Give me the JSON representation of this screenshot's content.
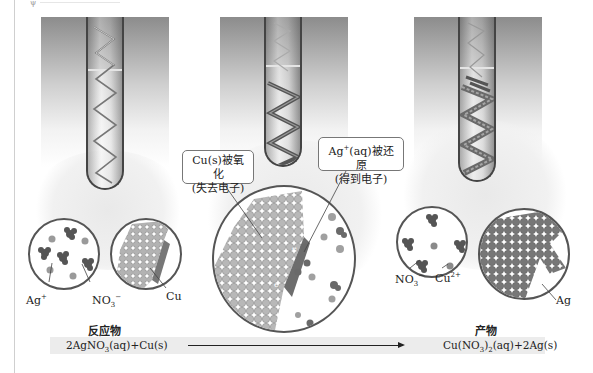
{
  "figure": {
    "stages": [
      {
        "id": "reactants",
        "description": "copper coil in silver nitrate solution"
      },
      {
        "id": "reaction",
        "description": "copper coil being coated with silver"
      },
      {
        "id": "products",
        "description": "silver crystals on coil, blue solution"
      }
    ],
    "callouts": {
      "oxidation": {
        "line1": "Cu(s)被氧化",
        "line2": "(失去电子)"
      },
      "reduction": {
        "line1_base": "Ag",
        "line1_sup": "+",
        "line1_rest": "(aq)被还原",
        "line2": "(得到电子)"
      }
    },
    "labels": {
      "ag_ion": {
        "base": "Ag",
        "sup": "+"
      },
      "nitrate_left": {
        "base": "NO",
        "sub": "3",
        "sup": "−"
      },
      "cu_left": "Cu",
      "nitrate_right": {
        "base": "NO",
        "sub": "3",
        "sup": "−"
      },
      "cu_ion": {
        "base": "Cu",
        "sup": "2+"
      },
      "ag_right": "Ag",
      "electron": "e"
    },
    "reactants_heading": "反应物",
    "products_heading": "产物",
    "equation": {
      "left": {
        "p1": "2AgNO",
        "sub": "3",
        "p2": "(aq)+Cu(s)"
      },
      "right": {
        "p1": "Cu(NO",
        "sub1": "3",
        "p2": ")",
        "sub2": "2",
        "p3": "(aq)+2Ag(s)"
      }
    }
  },
  "colors": {
    "ion_dark": "#555555",
    "ion_light": "#9a9a9a",
    "copper_atom": "#b0b0b0",
    "silver_atom": "#6e6e6e",
    "equation_bar": "#ececec"
  }
}
